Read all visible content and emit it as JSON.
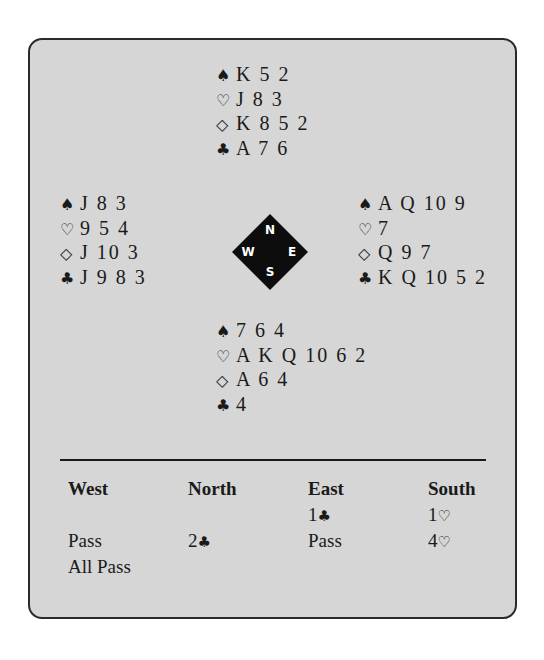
{
  "hands": {
    "north": {
      "spades": "K 5 2",
      "hearts": "J 8 3",
      "diamonds": "K 8 5 2",
      "clubs": "A 7 6"
    },
    "west": {
      "spades": "J 8 3",
      "hearts": "9 5 4",
      "diamonds": "J 10 3",
      "clubs": "J 9 8 3"
    },
    "east": {
      "spades": "A Q 10 9",
      "hearts": "7",
      "diamonds": "Q 9 7",
      "clubs": "K Q 10 5 2"
    },
    "south": {
      "spades": "7 6 4",
      "hearts": "A K Q 10 6 2",
      "diamonds": "A 6 4",
      "clubs": "4"
    }
  },
  "suit_symbols": {
    "spades": "♠",
    "hearts": "♡",
    "diamonds": "◇",
    "clubs": "♣"
  },
  "compass": {
    "n": "N",
    "e": "E",
    "s": "S",
    "w": "W"
  },
  "auction": {
    "headers": [
      "West",
      "North",
      "East",
      "South"
    ],
    "rows": [
      {
        "east_num": "1",
        "east_suit": "♣",
        "south_num": "1",
        "south_suit": "♡"
      },
      {
        "west": "Pass",
        "north_num": "2",
        "north_suit": "♣",
        "east": "Pass",
        "south_num": "4",
        "south_suit": "♡"
      },
      {
        "west": "All Pass"
      }
    ]
  }
}
